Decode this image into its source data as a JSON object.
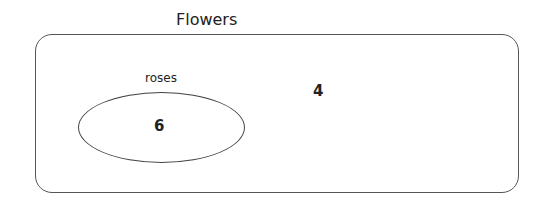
{
  "diagram": {
    "type": "venn",
    "universe": {
      "label": "Flowers",
      "count_outside_sets": "4"
    },
    "sets": [
      {
        "label": "roses",
        "count": "6"
      }
    ],
    "stroke_color": "#555555"
  }
}
